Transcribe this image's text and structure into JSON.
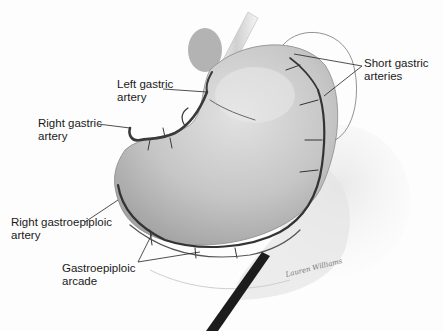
{
  "figure": {
    "labels": [
      {
        "id": "left-gastric-artery",
        "text": "Left gastric\nartery",
        "x": 117,
        "y": 78
      },
      {
        "id": "right-gastric-artery",
        "text": "Right gastric\nartery",
        "x": 38,
        "y": 117
      },
      {
        "id": "short-gastric-arteries",
        "text": "Short gastric\narteries",
        "x": 364,
        "y": 57
      },
      {
        "id": "right-gastroepiploic-artery",
        "text": "Right gastroepiploic\nartery",
        "x": 11,
        "y": 216
      },
      {
        "id": "gastroepiploic-arcade",
        "text": "Gastroepiploic\narcade",
        "x": 62,
        "y": 262
      }
    ],
    "signature": "Lauren Williams",
    "colors": {
      "background": "#fdfdfd",
      "stomach": "#c8c8c8",
      "vessel": "#3a3a3a",
      "text": "#1a1a1a",
      "instrument": "#1c1c1c"
    }
  }
}
